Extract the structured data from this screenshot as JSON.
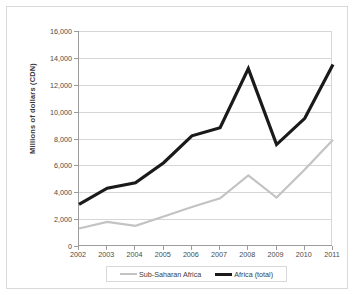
{
  "chart_data": {
    "type": "line",
    "title": "",
    "xlabel": "",
    "ylabel": "Millions of dollars (CDN)",
    "categories": [
      "2002",
      "2003",
      "2004",
      "2005",
      "2006",
      "2007",
      "2008",
      "2009",
      "2010",
      "2011"
    ],
    "x": [
      2002,
      2003,
      2004,
      2005,
      2006,
      2007,
      2008,
      2009,
      2010,
      2011
    ],
    "ylim": [
      0,
      16000
    ],
    "xlim": [
      2002,
      2011
    ],
    "ytick_labels": [
      "0",
      "2,000",
      "4,000",
      "6,000",
      "8,000",
      "10,000",
      "12,000",
      "14,000",
      "16,000"
    ],
    "ytick_values": [
      0,
      2000,
      4000,
      6000,
      8000,
      10000,
      12000,
      14000,
      16000
    ],
    "grid": true,
    "grid_axis": "y",
    "legend_position": "bottom",
    "series": [
      {
        "name": "Sub-Saharan Africa",
        "color": "#c3c3c3",
        "width": 2.2,
        "values": [
          1300,
          1800,
          1500,
          2200,
          2900,
          3550,
          5250,
          3600,
          5700,
          7900
        ]
      },
      {
        "name": "Africa (total)",
        "color": "#1a1a1a",
        "width": 3.2,
        "values": [
          3100,
          4300,
          4700,
          6200,
          8200,
          8800,
          13200,
          7550,
          9500,
          13500
        ]
      }
    ]
  },
  "legend": {
    "entries": [
      {
        "label": "Sub-Saharan Africa"
      },
      {
        "label": "Africa (total)"
      }
    ]
  },
  "colors": {
    "sub_saharan_africa": "#c3c3c3",
    "africa_total": "#1a1a1a",
    "gridline": "#d6d6d6",
    "axis": "#9c9c9c",
    "background": "#ffffff"
  }
}
